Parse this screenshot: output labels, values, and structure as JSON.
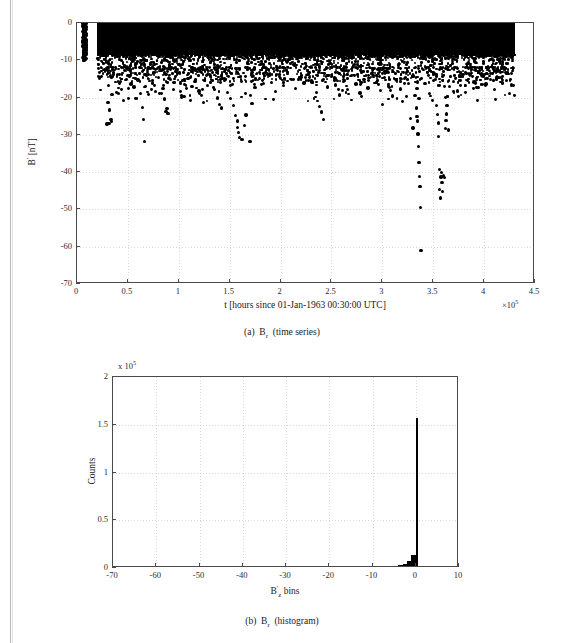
{
  "figure": {
    "panels": [
      {
        "id": "panel-a",
        "caption_prefix": "(a)",
        "caption_symbol": "B",
        "caption_sub": "r",
        "caption_suffix": "(time series)"
      },
      {
        "id": "panel-b",
        "caption_prefix": "(b)",
        "caption_symbol": "B",
        "caption_sub": "r",
        "caption_suffix": "(histogram)"
      }
    ]
  },
  "chart_data": [
    {
      "type": "scatter",
      "title": "",
      "xlabel": "t [hours since 01-Jan-1963 00:30:00 UTC]",
      "ylabel": "B′ [nT]",
      "ylabel_symbol": "B",
      "ylabel_prime": "′",
      "ylabel_units": "[nT]",
      "xlim": [
        0,
        4.5
      ],
      "ylim": [
        -70,
        0
      ],
      "x_multiplier": "×10",
      "x_multiplier_exp": "5",
      "xticks": [
        0,
        0.5,
        1,
        1.5,
        2,
        2.5,
        3,
        3.5,
        4,
        4.5
      ],
      "xticklabels": [
        "0",
        "0.5",
        "1",
        "1.5",
        "2",
        "2.5",
        "3",
        "3.5",
        "4",
        "4.5"
      ],
      "yticks": [
        0,
        -10,
        -20,
        -30,
        -40,
        -50,
        -60,
        -70
      ],
      "yticklabels": [
        "0",
        "-10",
        "-20",
        "-30",
        "-40",
        "-50",
        "-60",
        "-70"
      ],
      "grid": true,
      "marker_color": "#000000",
      "dense_band": {
        "x_start": 0.2,
        "x_end": 4.3,
        "y_top": 0,
        "y_bottom": -8.5,
        "note": "near-solid black saturation of overlapping markers"
      },
      "isolated_cluster": {
        "x_start": 0.055,
        "x_end": 0.095,
        "y_top": 0,
        "y_bottom": -10.2
      },
      "points": [
        [
          0.065,
          -0.4
        ],
        [
          0.07,
          -1.6
        ],
        [
          0.062,
          -2.8
        ],
        [
          0.072,
          -3.9
        ],
        [
          0.066,
          -5.1
        ],
        [
          0.07,
          -6.3
        ],
        [
          0.063,
          -7.4
        ],
        [
          0.069,
          -8.6
        ],
        [
          0.066,
          -9.7
        ],
        [
          0.071,
          -10.1
        ],
        [
          0.3,
          -12.6
        ],
        [
          0.33,
          -14.2
        ],
        [
          0.31,
          -16.8
        ],
        [
          0.345,
          -19.1
        ],
        [
          0.305,
          -21.4
        ],
        [
          0.32,
          -23.3
        ],
        [
          0.335,
          -25.8
        ],
        [
          0.315,
          -26.9
        ],
        [
          0.34,
          -26.4
        ],
        [
          0.295,
          -27.1
        ],
        [
          0.4,
          -13.8
        ],
        [
          0.43,
          -15.7
        ],
        [
          0.41,
          -18.9
        ],
        [
          0.455,
          -20.8
        ],
        [
          0.5,
          -14.1
        ],
        [
          0.53,
          -16.4
        ],
        [
          0.56,
          -17.2
        ],
        [
          0.6,
          -15.3
        ],
        [
          0.625,
          -19.0
        ],
        [
          0.645,
          -22.6
        ],
        [
          0.655,
          -25.9
        ],
        [
          0.665,
          -31.7
        ],
        [
          0.7,
          -13.9
        ],
        [
          0.74,
          -16.1
        ],
        [
          0.77,
          -18.3
        ],
        [
          0.8,
          -14.7
        ],
        [
          0.845,
          -17.6
        ],
        [
          0.86,
          -20.4
        ],
        [
          0.885,
          -22.9
        ],
        [
          0.875,
          -23.8
        ],
        [
          0.895,
          -24.2
        ],
        [
          0.92,
          -15.2
        ],
        [
          0.95,
          -17.9
        ],
        [
          0.99,
          -13.4
        ],
        [
          1.02,
          -16.3
        ],
        [
          1.05,
          -19.8
        ],
        [
          1.09,
          -14.9
        ],
        [
          1.13,
          -17.1
        ],
        [
          1.16,
          -15.6
        ],
        [
          1.2,
          -18.2
        ],
        [
          1.24,
          -21.3
        ],
        [
          1.28,
          -16.7
        ],
        [
          1.31,
          -14.2
        ],
        [
          1.35,
          -17.8
        ],
        [
          1.38,
          -20.1
        ],
        [
          1.4,
          -21.9
        ],
        [
          1.42,
          -22.8
        ],
        [
          1.45,
          -15.4
        ],
        [
          1.48,
          -18.6
        ],
        [
          1.51,
          -20.3
        ],
        [
          1.54,
          -22.1
        ],
        [
          1.56,
          -24.9
        ],
        [
          1.575,
          -26.3
        ],
        [
          1.58,
          -28.1
        ],
        [
          1.585,
          -29.4
        ],
        [
          1.6,
          -30.8
        ],
        [
          1.62,
          -31.2
        ],
        [
          1.645,
          -27.4
        ],
        [
          1.66,
          -24.7
        ],
        [
          1.7,
          -31.8
        ],
        [
          1.72,
          -21.6
        ],
        [
          1.75,
          -17.3
        ],
        [
          1.79,
          -14.8
        ],
        [
          1.83,
          -16.2
        ],
        [
          1.87,
          -13.7
        ],
        [
          1.91,
          -15.9
        ],
        [
          1.95,
          -18.4
        ],
        [
          1.99,
          -14.3
        ],
        [
          2.03,
          -16.8
        ],
        [
          2.07,
          -13.2
        ],
        [
          2.11,
          -15.1
        ],
        [
          2.15,
          -17.6
        ],
        [
          2.19,
          -14.6
        ],
        [
          2.23,
          -16.1
        ],
        [
          2.27,
          -13.9
        ],
        [
          2.31,
          -15.8
        ],
        [
          2.35,
          -18.7
        ],
        [
          2.38,
          -22.4
        ],
        [
          2.4,
          -23.9
        ],
        [
          2.42,
          -25.8
        ],
        [
          2.46,
          -17.2
        ],
        [
          2.5,
          -14.4
        ],
        [
          2.54,
          -16.6
        ],
        [
          2.58,
          -19.3
        ],
        [
          2.62,
          -15.7
        ],
        [
          2.66,
          -17.9
        ],
        [
          2.7,
          -14.1
        ],
        [
          2.74,
          -16.4
        ],
        [
          2.78,
          -18.8
        ],
        [
          2.82,
          -15.2
        ],
        [
          2.86,
          -17.4
        ],
        [
          2.9,
          -13.8
        ],
        [
          2.94,
          -16.0
        ],
        [
          2.98,
          -18.1
        ],
        [
          3.0,
          -21.9
        ],
        [
          3.02,
          -14.6
        ],
        [
          3.06,
          -16.9
        ],
        [
          3.1,
          -19.6
        ],
        [
          3.14,
          -15.3
        ],
        [
          3.18,
          -17.7
        ],
        [
          3.22,
          -14.8
        ],
        [
          3.26,
          -16.2
        ],
        [
          3.28,
          -25.6
        ],
        [
          3.3,
          -28.2
        ],
        [
          3.32,
          -19.4
        ],
        [
          3.335,
          -22.8
        ],
        [
          3.34,
          -25.1
        ],
        [
          3.345,
          -26.3
        ],
        [
          3.35,
          -29.8
        ],
        [
          3.355,
          -33.1
        ],
        [
          3.36,
          -37.4
        ],
        [
          3.365,
          -41.2
        ],
        [
          3.37,
          -43.8
        ],
        [
          3.375,
          -49.4
        ],
        [
          3.38,
          -61.1
        ],
        [
          3.34,
          -17.6
        ],
        [
          3.345,
          -15.8
        ],
        [
          3.36,
          -20.2
        ],
        [
          3.3,
          -14.2
        ],
        [
          3.42,
          -16.3
        ],
        [
          3.46,
          -18.9
        ],
        [
          3.5,
          -15.4
        ],
        [
          3.53,
          -22.1
        ],
        [
          3.545,
          -24.6
        ],
        [
          3.55,
          -26.8
        ],
        [
          3.555,
          -30.4
        ],
        [
          3.56,
          -39.2
        ],
        [
          3.565,
          -44.6
        ],
        [
          3.57,
          -46.9
        ],
        [
          3.575,
          -41.3
        ],
        [
          3.58,
          -40.1
        ],
        [
          3.585,
          -42.8
        ],
        [
          3.59,
          -45.1
        ],
        [
          3.6,
          -40.9
        ],
        [
          3.61,
          -41.4
        ],
        [
          3.62,
          -28.3
        ],
        [
          3.625,
          -26.1
        ],
        [
          3.63,
          -24.4
        ],
        [
          3.635,
          -22.2
        ],
        [
          3.64,
          -19.7
        ],
        [
          3.65,
          -28.7
        ],
        [
          3.66,
          -17.1
        ],
        [
          3.7,
          -15.6
        ],
        [
          3.74,
          -18.2
        ],
        [
          3.78,
          -14.4
        ],
        [
          3.82,
          -16.7
        ],
        [
          3.86,
          -13.9
        ],
        [
          3.9,
          -15.8
        ],
        [
          3.94,
          -17.3
        ],
        [
          3.98,
          -14.1
        ],
        [
          4.02,
          -16.4
        ],
        [
          4.06,
          -15.2
        ],
        [
          4.1,
          -17.8
        ],
        [
          4.14,
          -14.6
        ],
        [
          4.18,
          -16.1
        ],
        [
          4.22,
          -15.4
        ],
        [
          4.25,
          -18.9
        ],
        [
          4.27,
          -16.6
        ]
      ]
    },
    {
      "type": "bar",
      "title": "",
      "xlabel": "B′z bins",
      "xlabel_symbol": "B",
      "xlabel_prime": "′",
      "xlabel_sub": "z",
      "xlabel_suffix": "bins",
      "ylabel": "Counts",
      "xlim": [
        -70,
        10
      ],
      "ylim": [
        0,
        2
      ],
      "y_multiplier": "x 10",
      "y_multiplier_exp": "5",
      "xticks": [
        -70,
        -60,
        -50,
        -40,
        -30,
        -20,
        -10,
        0,
        10
      ],
      "xticklabels": [
        "-70",
        "-60",
        "-50",
        "-40",
        "-30",
        "-20",
        "-10",
        "0",
        "10"
      ],
      "yticks": [
        0,
        0.5,
        1,
        1.5,
        2
      ],
      "yticklabels": [
        "0",
        "0.5",
        "1",
        "1.5",
        "2"
      ],
      "grid": true,
      "bar_color": "#000000",
      "peak_value": 1.57,
      "peak_bin": -0.5,
      "bins": [
        -70,
        -68,
        -66,
        -64,
        -62,
        -60,
        -58,
        -56,
        -54,
        -52,
        -50,
        -48,
        -46,
        -44,
        -42,
        -40,
        -38,
        -36,
        -34,
        -32,
        -30,
        -28,
        -26,
        -24,
        -22,
        -20,
        -18,
        -16,
        -14,
        -12,
        -10,
        -9,
        -8,
        -7,
        -6,
        -5,
        -4,
        -3,
        -2,
        -1,
        0
      ],
      "values": [
        0,
        0,
        0,
        0,
        0,
        0,
        0,
        0,
        0,
        0,
        0,
        0,
        0,
        0,
        0,
        0,
        0,
        0,
        0,
        0,
        0,
        0,
        0,
        0,
        0,
        0.001,
        0.001,
        0.002,
        0.002,
        0.003,
        0.004,
        0.005,
        0.007,
        0.009,
        0.013,
        0.019,
        0.028,
        0.043,
        0.072,
        0.135,
        1.57
      ]
    }
  ]
}
